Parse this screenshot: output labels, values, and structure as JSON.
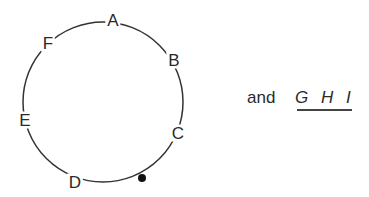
{
  "diagram": {
    "type": "circle-sequence",
    "circle": {
      "cx": 103,
      "cy": 102,
      "rx": 80,
      "ry": 80,
      "stroke": "#333333"
    },
    "labels": [
      {
        "text": "A",
        "x": 113,
        "y": 20
      },
      {
        "text": "B",
        "x": 174,
        "y": 60
      },
      {
        "text": "C",
        "x": 178,
        "y": 133
      },
      {
        "text": "D",
        "x": 75,
        "y": 182
      },
      {
        "text": "E",
        "x": 25,
        "y": 120
      },
      {
        "text": "F",
        "x": 48,
        "y": 43
      }
    ],
    "marker": {
      "x": 142,
      "y": 178,
      "r": 4,
      "color": "#111111"
    },
    "side_text": {
      "prefix": "and",
      "sequence": "G H I"
    }
  }
}
